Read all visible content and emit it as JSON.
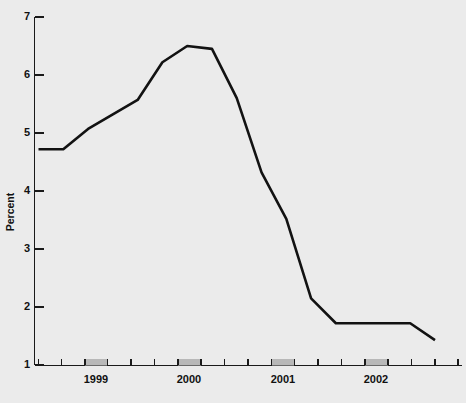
{
  "chart_data": {
    "type": "line",
    "title": "",
    "xlabel": "",
    "ylabel": "Percent",
    "ylim": [
      1,
      7
    ],
    "yticks": [
      1,
      2,
      3,
      4,
      5,
      6,
      7
    ],
    "ytick_labels": [
      "1",
      "2",
      "3",
      "4",
      "5",
      "6",
      "7"
    ],
    "xtick_labels": [
      "1999",
      "2000",
      "2001",
      "2002"
    ],
    "grid": false,
    "legend": false,
    "line_color": "#121212",
    "background_color": "#ebebeb",
    "shaded_band_color": "#b8b8b8",
    "x": [
      "1998Q3",
      "1998Q4",
      "1999Q1",
      "1999Q2",
      "1999Q3",
      "1999Q4",
      "2000Q1",
      "2000Q2",
      "2000Q3",
      "2000Q4",
      "2001Q1",
      "2001Q2",
      "2001Q3",
      "2001Q4",
      "2002Q1",
      "2002Q2",
      "2002Q3"
    ],
    "values": [
      4.72,
      4.72,
      5.07,
      5.32,
      5.57,
      6.22,
      6.5,
      6.45,
      5.6,
      4.32,
      3.52,
      2.15,
      1.72,
      1.72,
      1.72,
      1.72,
      1.43
    ],
    "shaded_bands": [
      {
        "label": "1999",
        "start": "1999Q1",
        "end": "1999Q2"
      },
      {
        "label": "2000",
        "start": "2000Q1",
        "end": "2000Q2"
      },
      {
        "label": "2001",
        "start": "2001Q1",
        "end": "2001Q2"
      },
      {
        "label": "2002",
        "start": "2002Q1",
        "end": "2002Q2"
      }
    ]
  },
  "axes": {
    "y_title": "Percent",
    "y_labels": [
      "7",
      "6",
      "5",
      "4",
      "3",
      "2",
      "1"
    ],
    "x_labels": [
      "1999",
      "2000",
      "2001",
      "2002"
    ]
  }
}
